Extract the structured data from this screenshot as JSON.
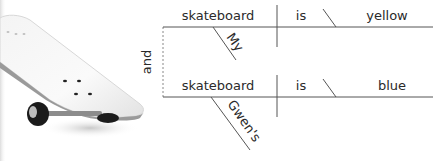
{
  "image": {
    "subject": "skateboard",
    "description": "White skateboard deck with black wheels, shown at an angle"
  },
  "diagram": {
    "type": "sentence-diagram",
    "conjunction": "and",
    "clauses": [
      {
        "subject": "skateboard",
        "verb": "is",
        "complement": "yellow",
        "modifier": "My"
      },
      {
        "subject": "skateboard",
        "verb": "is",
        "complement": "blue",
        "modifier": "Gwen's"
      }
    ]
  },
  "colors": {
    "line": "#555555",
    "text": "#2a2a2a",
    "dashed": "#888888",
    "background": "#ffffff"
  }
}
